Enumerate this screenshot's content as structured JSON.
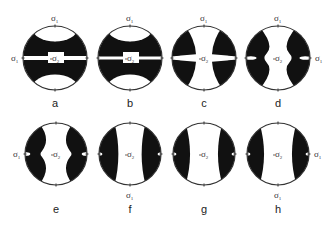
{
  "figure": {
    "panels": [
      {
        "id": "a",
        "letter": "a",
        "cx": 55,
        "cy": 58,
        "r": 32,
        "type": "lens_band",
        "band": "full_wide",
        "labels": [
          "top",
          "left",
          "center"
        ]
      },
      {
        "id": "b",
        "letter": "b",
        "cx": 130,
        "cy": 58,
        "r": 32,
        "type": "lens_band",
        "band": "full_thin",
        "labels": [
          "top",
          "center"
        ]
      },
      {
        "id": "c",
        "letter": "c",
        "cx": 204,
        "cy": 58,
        "r": 32,
        "type": "x_shape",
        "labels": [
          "top",
          "center"
        ]
      },
      {
        "id": "d",
        "letter": "d",
        "cx": 278,
        "cy": 58,
        "r": 32,
        "type": "side_bulge",
        "labels": [
          "top",
          "right",
          "center"
        ]
      },
      {
        "id": "e",
        "letter": "e",
        "cx": 56,
        "cy": 154,
        "r": 31,
        "type": "side_lobes_notched",
        "labels": [
          "left",
          "center"
        ]
      },
      {
        "id": "f",
        "letter": "f",
        "cx": 130,
        "cy": 154,
        "r": 31,
        "type": "side_lobes",
        "labels": [
          "bottom",
          "center"
        ]
      },
      {
        "id": "g",
        "letter": "g",
        "cx": 204,
        "cy": 154,
        "r": 31,
        "type": "side_lens",
        "labels": [
          "center"
        ]
      },
      {
        "id": "h",
        "letter": "h",
        "cx": 278,
        "cy": 154,
        "r": 31,
        "type": "side_lens",
        "labels": [
          "bottom",
          "right",
          "center"
        ]
      }
    ],
    "sigma1": {
      "symbol": "σ",
      "subscript": "1"
    },
    "sigma2": {
      "symbol": "σ",
      "subscript": "2"
    },
    "colors": {
      "fill": "#111111",
      "outline": "#333333",
      "background": "#ffffff"
    }
  }
}
